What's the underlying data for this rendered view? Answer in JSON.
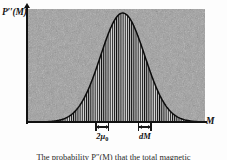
{
  "figure": {
    "kind": "probability-distribution-plot",
    "y_axis_label": "P′′(M)",
    "y_axis_label_base": "P",
    "y_axis_label_primes": "′′",
    "y_axis_label_arg": "(M)",
    "x_axis_label": "M",
    "caption_fragment": "The probability P″(M) that the total magnetic"
  },
  "markers": [
    {
      "id": "two-mu-zero",
      "label_main": "2μ",
      "label_sub": "0",
      "label_plain": "2μ₀",
      "center_x_frac": 0.42,
      "width_px": 14
    },
    {
      "id": "dM",
      "label_main": "dM",
      "label_sub": "",
      "label_plain": "dM",
      "center_x_frac": 0.66,
      "width_px": 14
    }
  ],
  "colors": {
    "plot_background": "#9a9a9a",
    "ink": "#111111",
    "curve_fill": "#0d0d0d",
    "page": "#fdfdfd"
  },
  "chart_data": {
    "type": "area",
    "title": "",
    "subtitle": "",
    "xlabel": "M",
    "ylabel": "P′′(M)",
    "xlim": [
      0,
      1
    ],
    "ylim": [
      0,
      1
    ],
    "grid": false,
    "legend": null,
    "annotations": [
      {
        "text": "2μ₀",
        "x": 0.42,
        "y": 0,
        "kind": "width-bracket",
        "description": "small interval of width two mu-zero marked beneath the axis left of centre"
      },
      {
        "text": "dM",
        "x": 0.66,
        "y": 0,
        "kind": "width-bracket",
        "description": "differential element dM marked beneath the axis right of centre"
      }
    ],
    "series": [
      {
        "name": "P''(M)",
        "description": "Gaussian peak centred near the middle of the M axis, vertically hatched beneath the curve",
        "fill": "vertical-hatch",
        "mean": 0.535,
        "sigma": 0.125,
        "peak_value": 1.0,
        "x": [
          0.0,
          0.04,
          0.08,
          0.12,
          0.16,
          0.2,
          0.24,
          0.28,
          0.32,
          0.36,
          0.4,
          0.44,
          0.48,
          0.52,
          0.56,
          0.6,
          0.64,
          0.68,
          0.72,
          0.76,
          0.8,
          0.84,
          0.88,
          0.92,
          0.96,
          1.0
        ],
        "values": [
          0.0,
          0.001,
          0.003,
          0.007,
          0.016,
          0.034,
          0.066,
          0.117,
          0.191,
          0.288,
          0.404,
          0.528,
          0.648,
          0.751,
          0.826,
          0.866,
          0.869,
          0.836,
          0.772,
          0.684,
          0.582,
          0.474,
          0.37,
          0.276,
          0.197,
          0.135
        ]
      }
    ]
  }
}
